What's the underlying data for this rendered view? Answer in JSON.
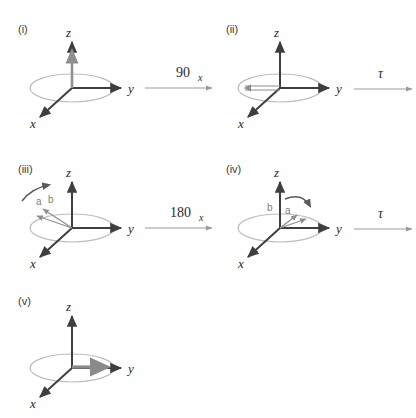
{
  "figure": {
    "background_color": "#ffffff",
    "axis_color": "#3f3f3f",
    "ring_color": "#bdbdbd",
    "gray_vector_color": "#8f8f8f",
    "label_color": "#3a3a3a"
  },
  "axes": {
    "z": "z",
    "y": "y",
    "x": "x"
  },
  "panels": [
    {
      "id": "panel-i",
      "label": "(i)",
      "magnetization": "along +z",
      "vectors": []
    },
    {
      "id": "panel-ii",
      "label": "(ii)",
      "magnetization": "along -y",
      "vectors": []
    },
    {
      "id": "panel-iii",
      "label": "(iii)",
      "magnetization": "dephasing, a and b along -y",
      "vectors": [
        "a",
        "b"
      ]
    },
    {
      "id": "panel-iv",
      "label": "(iv)",
      "magnetization": "refocusing, b and a along +y",
      "vectors": [
        "b",
        "a"
      ]
    },
    {
      "id": "panel-v",
      "label": "(v)",
      "magnetization": "refocused along +y",
      "vectors": []
    }
  ],
  "operations": [
    {
      "id": "op-90x",
      "value": "90",
      "subscript": "x",
      "from": "(i)",
      "to": "(ii)"
    },
    {
      "id": "op-tau-1",
      "value": "τ",
      "subscript": "",
      "from": "(ii)",
      "to": "(iii)"
    },
    {
      "id": "op-180x",
      "value": "180",
      "subscript": "x",
      "from": "(iii)",
      "to": "(iv)"
    },
    {
      "id": "op-tau-2",
      "value": "τ",
      "subscript": "",
      "from": "(iv)",
      "to": "(v)"
    }
  ],
  "vector_labels": {
    "a": "a",
    "b": "b"
  }
}
